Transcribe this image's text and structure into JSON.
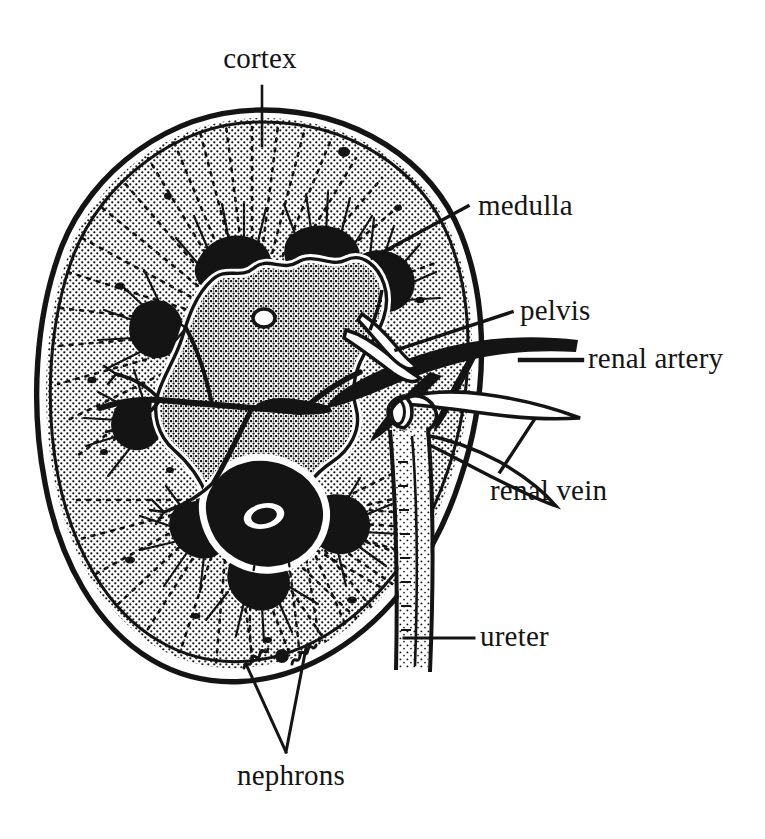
{
  "figure": {
    "style": "black-and-white halftone stipple line engraving",
    "background_color": "#ffffff",
    "ink_color": "#141414"
  },
  "labels": [
    {
      "id": "cortex",
      "text": "cortex",
      "x": 260,
      "y": 68,
      "anchor": "middle",
      "leader": "vertical line down from label to outer kidney capsule"
    },
    {
      "id": "medulla",
      "text": "medulla",
      "x": 478,
      "y": 215,
      "anchor": "start",
      "leader": "diagonal line down-left to a dark medullary pyramid"
    },
    {
      "id": "pelvis",
      "text": "pelvis",
      "x": 520,
      "y": 320,
      "anchor": "start",
      "leader": "diagonal line down-left to the renal pelvis"
    },
    {
      "id": "renal-artery",
      "text": "renal artery",
      "x": 588,
      "y": 368,
      "anchor": "start",
      "leader": "horizontal line left to the solid black renal artery"
    },
    {
      "id": "renal-vein",
      "text": "renal vein",
      "x": 490,
      "y": 500,
      "anchor": "start",
      "leader": "diagonal line up-right crossing the renal vein outline"
    },
    {
      "id": "ureter",
      "text": "ureter",
      "x": 480,
      "y": 646,
      "anchor": "start",
      "leader": "horizontal line left to the ureter tube"
    },
    {
      "id": "nephrons",
      "text": "nephrons",
      "x": 291,
      "y": 785,
      "anchor": "middle",
      "leader": "two lines forming a V up to two nephron tufts in the cortex"
    }
  ],
  "structures": [
    {
      "id": "capsule",
      "name": "renal capsule",
      "description": "double outline enclosing the bean-shaped kidney"
    },
    {
      "id": "cortex",
      "name": "cortex",
      "description": "stippled outer zone with radiating dotted tubules"
    },
    {
      "id": "medulla",
      "name": "medullary pyramids",
      "description": "solid black wedge shapes with radiating striations"
    },
    {
      "id": "pelvis",
      "name": "renal pelvis",
      "description": "wavy white-bordered funnel draining to the ureter"
    },
    {
      "id": "renal-artery",
      "name": "renal artery",
      "description": "thick solid black vessel entering the hilum"
    },
    {
      "id": "renal-vein",
      "name": "renal vein",
      "description": "outlined tube leaving the hilum"
    },
    {
      "id": "ureter",
      "name": "ureter",
      "description": "long tube descending from the pelvis"
    },
    {
      "id": "nephrons",
      "name": "nephrons",
      "description": "small squiggle tufts within the cortex"
    }
  ]
}
